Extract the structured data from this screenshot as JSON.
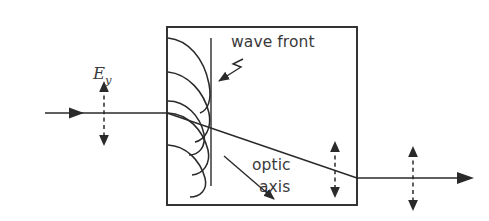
{
  "figure": {
    "background_color": "#ffffff",
    "ink_color": "#2a2a2a",
    "text_color": "#3a3a3a",
    "width": 489,
    "height": 221
  },
  "labels": {
    "field_symbol": "E",
    "field_subscript": "y",
    "wave_front": "wave front",
    "optic_axis_line1": "optic",
    "optic_axis_line2": "axis"
  },
  "elements": {
    "crystal_box": {
      "x": 167,
      "y": 27,
      "width": 190,
      "height": 178
    },
    "incident_ray": {
      "x1": 45,
      "y1": 113,
      "x2": 167,
      "y2": 113
    },
    "exit_ray": {
      "x1": 357,
      "y1": 178,
      "x2": 472,
      "y2": 178
    },
    "extraordinary_ray": {
      "x1": 167,
      "y1": 113,
      "x2": 357,
      "y2": 178
    },
    "wave_front_line": {
      "x": 211,
      "y1": 38,
      "y2": 186
    },
    "polarization_in": {
      "x": 104,
      "y_top": 83,
      "y_bottom": 144
    },
    "polarization_mid": {
      "x": 335,
      "y_top": 143,
      "y_bottom": 196
    },
    "polarization_out": {
      "x": 413,
      "y_top": 148,
      "y_bottom": 209
    },
    "wavelet_origins_y": [
      38,
      72,
      113,
      145,
      178
    ],
    "wavelet_count": 5
  }
}
